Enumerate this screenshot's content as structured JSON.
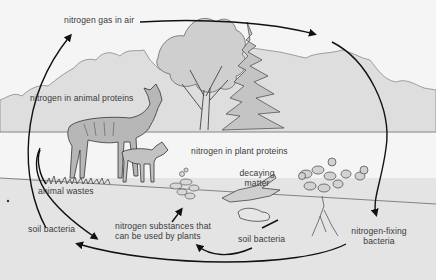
{
  "diagram": {
    "labels": {
      "nitrogen_gas_in_air": "nitrogen gas in air",
      "nitrogen_in_animal_proteins": "nitrogen in animal proteins",
      "nitrogen_in_plant_proteins": "nitrogen in plant proteins",
      "animal_wastes": "animal wastes",
      "decaying_matter_line1": "decaying",
      "decaying_matter_line2": "matter",
      "soil_bacteria_left": "soil bacteria",
      "nitrogen_substances_line1": "nitrogen substances that",
      "nitrogen_substances_line2": "can be used by plants",
      "soil_bacteria_center": "soil bacteria",
      "nitrogen_fixing_line1": "nitrogen-fixing",
      "nitrogen_fixing_line2": "bacteria"
    },
    "colors": {
      "sky": "#f5f5f5",
      "foliage": "#dcdcdc",
      "ground": "#e6e6e6",
      "line": "#1a1a1a",
      "text": "#3a3a3a"
    }
  }
}
